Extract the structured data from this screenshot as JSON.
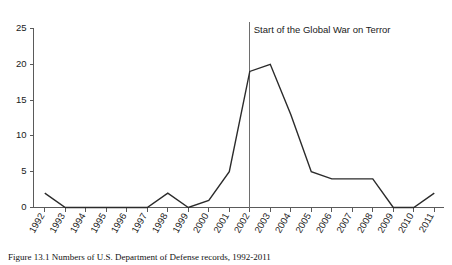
{
  "chart_data": {
    "type": "line",
    "title": "",
    "xlabel": "",
    "ylabel": "",
    "categories": [
      "1992",
      "1993",
      "1994",
      "1995",
      "1996",
      "1997",
      "1998",
      "1999",
      "2000",
      "2001",
      "2002",
      "2003",
      "2004",
      "2005",
      "2006",
      "2007",
      "2008",
      "2009",
      "2010",
      "2011"
    ],
    "values": [
      2,
      0,
      0,
      0,
      0,
      0,
      2,
      0,
      1,
      5,
      19,
      20,
      13,
      5,
      4,
      4,
      4,
      0,
      0,
      2
    ],
    "ylim": [
      0,
      25
    ],
    "yticks": [
      0,
      5,
      10,
      15,
      20,
      25
    ],
    "ytick_labels": [
      "0",
      "5",
      "10",
      "15",
      "20",
      "25"
    ],
    "grid": false,
    "legend": null,
    "annotations": [
      {
        "text": "Start of the Global War on Terror",
        "at_category": "2002",
        "type": "vertical-line-with-label"
      }
    ]
  },
  "caption": {
    "label": "Figure",
    "text": "Figure  13.1  Numbers of U.S. Department of Defense records, 1992-2011"
  }
}
